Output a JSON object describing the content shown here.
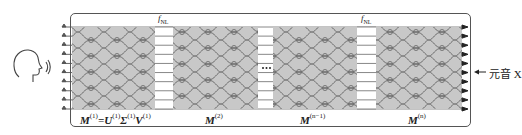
{
  "diagram": {
    "source_icon": "speaking-head-icon",
    "input_channels": 10,
    "nonlinear_label_main": "f",
    "nonlinear_label_sub": "NL",
    "ellipsis": "···",
    "blocks": [
      {
        "id": "M1",
        "label_main": "M",
        "label_sup": "(1)",
        "decomposition": "=U(1)Σ(1)V(1)"
      },
      {
        "id": "M2",
        "label_main": "M",
        "label_sup": "(2)"
      },
      {
        "id": "Mn-1",
        "label_main": "M",
        "label_sup": "(n−1)"
      },
      {
        "id": "Mn",
        "label_main": "M",
        "label_sup": "(n)"
      }
    ],
    "output_label": "元音 X",
    "colors": {
      "mesh_fill": "#c8c8c8",
      "mesh_line": "#6a6a6a",
      "frame": "#555555",
      "arrow": "#222222"
    }
  }
}
